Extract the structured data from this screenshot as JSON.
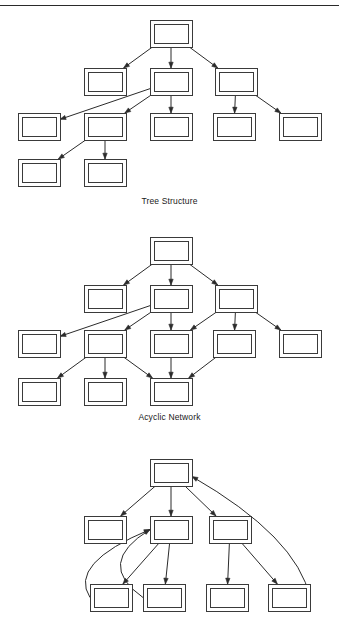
{
  "page": {
    "width": 339,
    "height": 622,
    "background": "#ffffff",
    "ink_color": "#2b2b2b",
    "has_top_rule": true,
    "top_rule_y": 5
  },
  "node_style": {
    "outer_width": 42,
    "outer_height": 27,
    "inner_inset": 4,
    "stroke": "#3a3a3a",
    "fill": "#ffffff",
    "label": ""
  },
  "figures": [
    {
      "id": "tree-structure",
      "caption": "Tree Structure",
      "caption_y": 196,
      "type": "directed-acyclic-tree",
      "origin_y": 14,
      "height": 190,
      "node_count": 11,
      "edge_count": 10,
      "nodes": [
        {
          "id": "t0",
          "x": 150,
          "y": 20,
          "row": 0
        },
        {
          "id": "t1",
          "x": 84,
          "y": 68,
          "row": 1
        },
        {
          "id": "t2",
          "x": 150,
          "y": 68,
          "row": 1
        },
        {
          "id": "t3",
          "x": 215,
          "y": 68,
          "row": 1
        },
        {
          "id": "t4",
          "x": 18,
          "y": 113,
          "row": 2
        },
        {
          "id": "t5",
          "x": 84,
          "y": 113,
          "row": 2
        },
        {
          "id": "t6",
          "x": 150,
          "y": 113,
          "row": 2
        },
        {
          "id": "t7",
          "x": 213,
          "y": 113,
          "row": 2
        },
        {
          "id": "t8",
          "x": 279,
          "y": 113,
          "row": 2
        },
        {
          "id": "t9",
          "x": 18,
          "y": 159,
          "row": 3
        },
        {
          "id": "t10",
          "x": 84,
          "y": 159,
          "row": 3
        }
      ],
      "edges": [
        {
          "from": "t0",
          "to": "t1",
          "curved": false
        },
        {
          "from": "t0",
          "to": "t2",
          "curved": false
        },
        {
          "from": "t0",
          "to": "t3",
          "curved": false
        },
        {
          "from": "t2",
          "to": "t4",
          "curved": false
        },
        {
          "from": "t2",
          "to": "t5",
          "curved": false
        },
        {
          "from": "t2",
          "to": "t6",
          "curved": false
        },
        {
          "from": "t3",
          "to": "t7",
          "curved": false
        },
        {
          "from": "t3",
          "to": "t8",
          "curved": false
        },
        {
          "from": "t5",
          "to": "t9",
          "curved": false
        },
        {
          "from": "t5",
          "to": "t10",
          "curved": false
        }
      ]
    },
    {
      "id": "acyclic-network",
      "caption": "Acyclic Network",
      "caption_y": 412,
      "type": "directed-acyclic-graph",
      "origin_y": 232,
      "height": 190,
      "node_count": 12,
      "edge_count": 15,
      "nodes": [
        {
          "id": "a0",
          "x": 150,
          "y": 237,
          "row": 0
        },
        {
          "id": "a1",
          "x": 84,
          "y": 285,
          "row": 1
        },
        {
          "id": "a2",
          "x": 150,
          "y": 285,
          "row": 1
        },
        {
          "id": "a3",
          "x": 215,
          "y": 285,
          "row": 1
        },
        {
          "id": "a4",
          "x": 18,
          "y": 330,
          "row": 2
        },
        {
          "id": "a5",
          "x": 84,
          "y": 330,
          "row": 2
        },
        {
          "id": "a6",
          "x": 150,
          "y": 330,
          "row": 2
        },
        {
          "id": "a7",
          "x": 213,
          "y": 330,
          "row": 2
        },
        {
          "id": "a8",
          "x": 279,
          "y": 330,
          "row": 2
        },
        {
          "id": "a9",
          "x": 18,
          "y": 378,
          "row": 3
        },
        {
          "id": "a10",
          "x": 84,
          "y": 378,
          "row": 3
        },
        {
          "id": "a11",
          "x": 150,
          "y": 378,
          "row": 3
        }
      ],
      "edges": [
        {
          "from": "a0",
          "to": "a1",
          "curved": false
        },
        {
          "from": "a0",
          "to": "a2",
          "curved": false
        },
        {
          "from": "a0",
          "to": "a3",
          "curved": false
        },
        {
          "from": "a2",
          "to": "a4",
          "curved": false
        },
        {
          "from": "a2",
          "to": "a5",
          "curved": false
        },
        {
          "from": "a2",
          "to": "a6",
          "curved": false
        },
        {
          "from": "a3",
          "to": "a6",
          "curved": false
        },
        {
          "from": "a3",
          "to": "a7",
          "curved": false
        },
        {
          "from": "a3",
          "to": "a8",
          "curved": false
        },
        {
          "from": "a5",
          "to": "a9",
          "curved": false
        },
        {
          "from": "a5",
          "to": "a10",
          "curved": false
        },
        {
          "from": "a5",
          "to": "a11",
          "curved": false
        },
        {
          "from": "a6",
          "to": "a11",
          "curved": false
        },
        {
          "from": "a7",
          "to": "a11",
          "curved": false
        }
      ]
    },
    {
      "id": "cyclic-network",
      "caption": "",
      "caption_y": 0,
      "type": "directed-cyclic-graph",
      "origin_y": 450,
      "height": 172,
      "clipped_at_bottom": true,
      "node_count": 8,
      "edge_count": 10,
      "nodes": [
        {
          "id": "c0",
          "x": 150,
          "y": 459,
          "row": 0
        },
        {
          "id": "c1",
          "x": 84,
          "y": 516,
          "row": 1
        },
        {
          "id": "c2",
          "x": 150,
          "y": 516,
          "row": 1
        },
        {
          "id": "c3",
          "x": 209,
          "y": 516,
          "row": 1
        },
        {
          "id": "c4",
          "x": 90,
          "y": 584,
          "row": 2
        },
        {
          "id": "c5",
          "x": 143,
          "y": 584,
          "row": 2
        },
        {
          "id": "c6",
          "x": 206,
          "y": 584,
          "row": 2
        },
        {
          "id": "c7",
          "x": 268,
          "y": 584,
          "row": 2
        }
      ],
      "edges": [
        {
          "from": "c0",
          "to": "c1",
          "curved": false
        },
        {
          "from": "c0",
          "to": "c2",
          "curved": false
        },
        {
          "from": "c0",
          "to": "c3",
          "curved": false
        },
        {
          "from": "c2",
          "to": "c4",
          "curved": false
        },
        {
          "from": "c2",
          "to": "c5",
          "curved": false
        },
        {
          "from": "c3",
          "to": "c6",
          "curved": false
        },
        {
          "from": "c3",
          "to": "c7",
          "curved": false
        },
        {
          "from": "c7",
          "to": "c0",
          "curved": true,
          "note": "back-edge forming cycle"
        },
        {
          "from": "c4",
          "to": "c2",
          "curved": true,
          "note": "back-edge forming cycle"
        },
        {
          "from": "c5",
          "to": "c2",
          "curved": true,
          "note": "back-edge forming cycle"
        }
      ]
    }
  ]
}
